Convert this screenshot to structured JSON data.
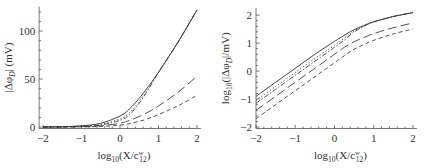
{
  "chart_data": [
    {
      "type": "line",
      "title": "",
      "xlabel": "log10(X/c12^w)",
      "ylabel": "|Δφ_D| (mV)",
      "xlim": [
        -2.1,
        2.1
      ],
      "ylim": [
        -2,
        125
      ],
      "xticks": [
        "-2",
        "-1",
        "0",
        "1",
        "2"
      ],
      "yticks": [
        "0",
        "50",
        "100"
      ],
      "grid": false,
      "legend": "none",
      "x": [
        -2,
        -1.5,
        -1,
        -0.5,
        0,
        0.25,
        0.5,
        0.75,
        1,
        1.5,
        2
      ],
      "series": [
        {
          "name": "solid",
          "style": "solid",
          "values": [
            0.13,
            0.4,
            1.3,
            3.9,
            11.5,
            19,
            30,
            43,
            57,
            88,
            122
          ]
        },
        {
          "name": "dotted",
          "style": "dotted",
          "values": [
            0.09,
            0.28,
            0.9,
            2.8,
            8.5,
            15,
            27,
            41,
            57,
            88,
            122
          ]
        },
        {
          "name": "dash-dot",
          "style": "dashdot",
          "values": [
            0.07,
            0.22,
            0.7,
            2.2,
            7,
            13,
            25,
            40,
            57,
            88,
            122
          ]
        },
        {
          "name": "long-dash",
          "style": "longdash",
          "values": [
            0.04,
            0.12,
            0.4,
            1.3,
            4,
            7,
            11,
            16,
            22,
            36,
            53
          ]
        },
        {
          "name": "short-dash",
          "style": "shortdash",
          "values": [
            0.02,
            0.06,
            0.2,
            0.63,
            2,
            3.6,
            6,
            9,
            13,
            22,
            33
          ]
        }
      ]
    },
    {
      "type": "line",
      "title": "",
      "xlabel": "log10(X/c12^w)",
      "ylabel": "log10(|Δφ_D|/mV)",
      "xlim": [
        -2.1,
        2.1
      ],
      "ylim": [
        -2,
        2.25
      ],
      "xticks": [
        "-2",
        "-1",
        "0",
        "1",
        "2"
      ],
      "yticks": [
        "-2",
        "-1",
        "0",
        "1",
        "2"
      ],
      "grid": false,
      "legend": "none",
      "x": [
        -2,
        -1.5,
        -1,
        -0.5,
        0,
        0.25,
        0.5,
        0.75,
        1,
        1.5,
        2
      ],
      "series": [
        {
          "name": "solid",
          "style": "solid",
          "values": [
            -0.9,
            -0.4,
            0.1,
            0.6,
            1.06,
            1.28,
            1.48,
            1.63,
            1.76,
            1.95,
            2.09
          ]
        },
        {
          "name": "dotted",
          "style": "dotted",
          "values": [
            -1.05,
            -0.55,
            -0.05,
            0.45,
            0.93,
            1.18,
            1.43,
            1.61,
            1.76,
            1.95,
            2.09
          ]
        },
        {
          "name": "dash-dot",
          "style": "dashdot",
          "values": [
            -1.15,
            -0.65,
            -0.15,
            0.35,
            0.85,
            1.11,
            1.4,
            1.6,
            1.76,
            1.95,
            2.09
          ]
        },
        {
          "name": "long-dash",
          "style": "longdash",
          "values": [
            -1.4,
            -0.9,
            -0.4,
            0.1,
            0.6,
            0.85,
            1.05,
            1.2,
            1.34,
            1.55,
            1.72
          ]
        },
        {
          "name": "short-dash",
          "style": "shortdash",
          "values": [
            -1.7,
            -1.2,
            -0.7,
            -0.2,
            0.3,
            0.55,
            0.78,
            0.95,
            1.1,
            1.33,
            1.5
          ]
        }
      ]
    }
  ],
  "panels": {
    "left": {
      "ylabel_text": "|Δφ",
      "ylabel_sub": "D",
      "ylabel_tail": "| (mV)",
      "xlabel_pre": "log",
      "xlabel_sub": "10",
      "xlabel_mid": "(X/c",
      "xlabel_sup": "w",
      "xlabel_sub2": "12",
      "xlabel_tail": ")"
    },
    "right": {
      "ylabel_pre": "log",
      "ylabel_sub": "10",
      "ylabel_mid": "(|Δφ",
      "ylabel_sub2": "D",
      "ylabel_tail": "|/mV)",
      "xlabel_pre": "log",
      "xlabel_sub": "10",
      "xlabel_mid": "(X/c",
      "xlabel_sup": "w",
      "xlabel_sub2": "12",
      "xlabel_tail": ")"
    }
  }
}
